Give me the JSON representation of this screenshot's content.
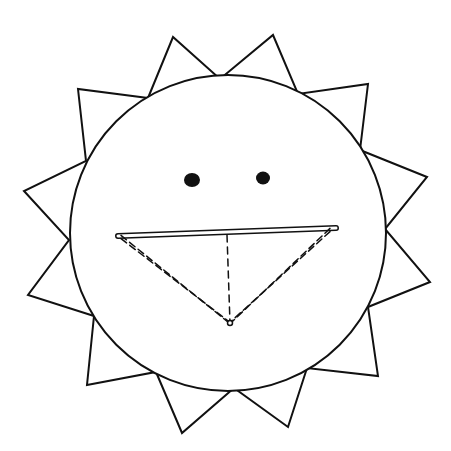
{
  "colors": {
    "stroke": "#111111",
    "background": "#ffffff",
    "fill": "#ffffff"
  },
  "sun": {
    "face": {
      "cx": 228,
      "cy": 233,
      "r": 158
    },
    "rays_polyline": [
      [
        148,
        98
      ],
      [
        173,
        37
      ],
      [
        220,
        79
      ],
      [
        273,
        35
      ],
      [
        298,
        94
      ],
      [
        368,
        84
      ],
      [
        360,
        150
      ],
      [
        427,
        177
      ],
      [
        385,
        229
      ],
      [
        430,
        282
      ],
      [
        368,
        307
      ],
      [
        378,
        376
      ],
      [
        307,
        368
      ],
      [
        288,
        427
      ],
      [
        234,
        388
      ],
      [
        182,
        433
      ],
      [
        156,
        372
      ],
      [
        87,
        385
      ],
      [
        94,
        316
      ],
      [
        28,
        295
      ],
      [
        69,
        240
      ],
      [
        24,
        191
      ],
      [
        86,
        161
      ],
      [
        78,
        89
      ],
      [
        148,
        98
      ]
    ],
    "ray_count": 12
  },
  "eyes": [
    {
      "name": "left-eye",
      "cx": 192,
      "cy": 180,
      "rx": 8,
      "ry": 7
    },
    {
      "name": "right-eye",
      "cx": 263,
      "cy": 178,
      "rx": 7,
      "ry": 6.5
    }
  ],
  "mouth": {
    "top_bar": {
      "x1": 118,
      "y1": 236,
      "x2": 336,
      "y2": 228
    },
    "vertex": {
      "x": 230,
      "y": 323
    },
    "center_line_top": {
      "x": 227,
      "y": 235
    }
  }
}
